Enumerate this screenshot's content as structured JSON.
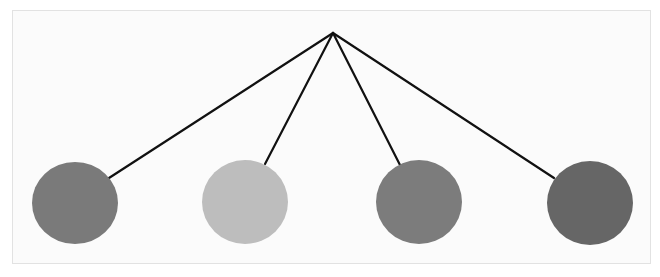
{
  "diagram": {
    "type": "tree",
    "frame": {
      "border_color": "#e2e2e2",
      "background": "#fbfbfb"
    },
    "root": {
      "x": 333,
      "y": 33
    },
    "edge_color": "#111111",
    "edge_width": 2.2,
    "nodes": [
      {
        "id": "node-1",
        "cx": 75,
        "cy": 203,
        "rx": 43,
        "ry": 41,
        "fill": "#7a7a7a",
        "attach": {
          "x": 109,
          "y": 178
        }
      },
      {
        "id": "node-2",
        "cx": 245,
        "cy": 202,
        "rx": 43,
        "ry": 42,
        "fill": "#bdbdbd",
        "attach": {
          "x": 265,
          "y": 164
        }
      },
      {
        "id": "node-3",
        "cx": 419,
        "cy": 202,
        "rx": 43,
        "ry": 42,
        "fill": "#7c7c7c",
        "attach": {
          "x": 400,
          "y": 165
        }
      },
      {
        "id": "node-4",
        "cx": 590,
        "cy": 203,
        "rx": 43,
        "ry": 42,
        "fill": "#666666",
        "attach": {
          "x": 554,
          "y": 178
        }
      }
    ]
  }
}
